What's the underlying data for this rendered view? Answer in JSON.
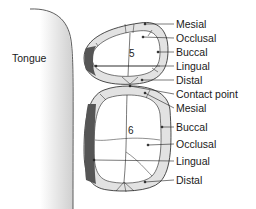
{
  "diagram": {
    "tongue_label": "Tongue",
    "tooth_upper": {
      "number": "5",
      "labels": [
        "Mesial",
        "Occlusal",
        "Buccal",
        "Lingual",
        "Distal"
      ]
    },
    "contact_point_label": "Contact point",
    "tooth_lower": {
      "number": "6",
      "labels": [
        "Mesial",
        "Buccal",
        "Occlusal",
        "Lingual",
        "Distal"
      ]
    },
    "colors": {
      "enamel_light": "#e2e2e2",
      "lingual_dark": "#555555",
      "outline": "#222222",
      "tongue_shade": "#d8d8d8"
    }
  }
}
